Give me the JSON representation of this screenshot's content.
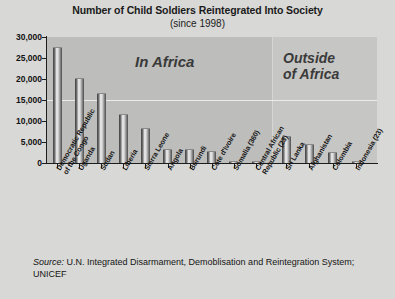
{
  "chart_data": {
    "type": "bar",
    "title": "Number of Child Soldiers Reintegrated Into Society",
    "subtitle": "(since 1998)",
    "xlabel": "",
    "ylabel": "",
    "ylim": [
      0,
      30000
    ],
    "grid": true,
    "legend_position": "none",
    "y_ticks": [
      "0",
      "5,000",
      "10,000",
      "15,000",
      "20,000",
      "25,000",
      "30,000"
    ],
    "y_tick_values": [
      0,
      5000,
      10000,
      15000,
      20000,
      25000,
      30000
    ],
    "categories": [
      "Democratic Republic of the Congo",
      "Uganda",
      "Sudan",
      "Liberia",
      "Sierra Leone",
      "Angola",
      "Burundi",
      "Cote d'Ivoire",
      "Somalia (360)",
      "Central African Republic (23)",
      "Sri Lanka",
      "Afghanistan",
      "Colombia",
      "Indonesia (23)"
    ],
    "values": [
      27500,
      20000,
      16500,
      11500,
      8000,
      3200,
      3000,
      2600,
      360,
      23,
      6200,
      4200,
      2500,
      23
    ],
    "annotations": [
      {
        "text": "In Africa",
        "region": "africa"
      },
      {
        "text": "Outside of Africa",
        "region": "outside"
      }
    ],
    "groups": [
      {
        "label": "In Africa",
        "categories_start": 0,
        "categories_end": 9
      },
      {
        "label": "Outside of Africa",
        "categories_start": 10,
        "categories_end": 13
      }
    ],
    "colors": {
      "bar": "#8a8a8a",
      "region_africa": "#bdbdbb",
      "region_outside": "#c6c6c4",
      "background": "#d8d8d6",
      "axis": "#1d1d1d",
      "text": "#141414"
    }
  },
  "annotations": {
    "in_africa": "In Africa",
    "outside_africa_line1": "Outside",
    "outside_africa_line2": "of Africa"
  },
  "source": {
    "label": "Source:",
    "text": "U.N. Integrated Disarmament, Demoblisation and Reintegration System; UNICEF"
  },
  "category_lines": [
    {
      "l1": "Democratic Republic",
      "l2": "of the Congo"
    },
    {
      "l1": "Uganda",
      "l2": ""
    },
    {
      "l1": "Sudan",
      "l2": ""
    },
    {
      "l1": "Liberia",
      "l2": ""
    },
    {
      "l1": "Sierra Leone",
      "l2": ""
    },
    {
      "l1": "Angola",
      "l2": ""
    },
    {
      "l1": "Burundi",
      "l2": ""
    },
    {
      "l1": "Cote d'Ivoire",
      "l2": ""
    },
    {
      "l1": "Somalia (360)",
      "l2": ""
    },
    {
      "l1": "Central African",
      "l2": "Republic (23)"
    },
    {
      "l1": "Sri Lanka",
      "l2": ""
    },
    {
      "l1": "Afghanistan",
      "l2": ""
    },
    {
      "l1": "Colombia",
      "l2": ""
    },
    {
      "l1": "Indonesia (23)",
      "l2": ""
    }
  ]
}
